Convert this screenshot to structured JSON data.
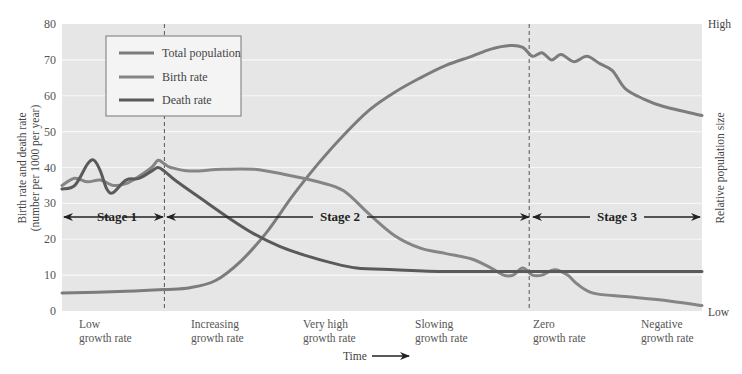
{
  "chart_data": {
    "type": "line",
    "title": "",
    "xlabel": "Time",
    "ylabel": "Birth rate and death rate",
    "ylabel_sub": "(number per 1000 per year)",
    "y2label": "Relative population size",
    "y2_ticks": {
      "high": "High",
      "low": "Low"
    },
    "ylim": [
      0,
      80
    ],
    "yticks": [
      0,
      10,
      20,
      30,
      40,
      50,
      60,
      70,
      80
    ],
    "grid": true,
    "legend_position": "upper-left",
    "x": [
      0,
      4,
      8,
      12,
      16,
      20,
      24,
      28,
      32,
      36,
      40,
      44,
      48,
      52,
      56,
      60,
      64,
      68,
      72,
      76,
      80,
      84,
      88,
      92,
      96,
      100
    ],
    "x_note": "x is relative time in percent of the horizontal axis (no numeric ticks shown)",
    "series": [
      {
        "name": "Total population",
        "color": "#7c7c7c",
        "axis": "right (relative, drawn on 0-80 scale)",
        "points": [
          [
            0,
            5
          ],
          [
            10,
            5.5
          ],
          [
            16,
            6
          ],
          [
            20,
            6.5
          ],
          [
            24,
            8.5
          ],
          [
            28,
            14
          ],
          [
            32,
            22
          ],
          [
            36,
            32
          ],
          [
            40,
            41
          ],
          [
            44,
            49
          ],
          [
            48,
            56
          ],
          [
            52,
            61
          ],
          [
            56,
            65
          ],
          [
            60,
            68.5
          ],
          [
            64,
            71
          ],
          [
            67,
            73
          ],
          [
            70,
            74
          ],
          [
            72,
            73.5
          ],
          [
            73.5,
            71
          ],
          [
            75,
            72
          ],
          [
            76.5,
            70
          ],
          [
            78,
            71.5
          ],
          [
            80,
            69.5
          ],
          [
            82,
            71
          ],
          [
            84,
            69
          ],
          [
            86,
            67
          ],
          [
            88,
            62
          ],
          [
            91,
            59
          ],
          [
            94,
            57
          ],
          [
            100,
            54.5
          ]
        ]
      },
      {
        "name": "Birth rate",
        "color": "#858585",
        "axis": "left",
        "points": [
          [
            0,
            35
          ],
          [
            2,
            37
          ],
          [
            4,
            36
          ],
          [
            6,
            36.5
          ],
          [
            8,
            35
          ],
          [
            10,
            35.5
          ],
          [
            12,
            37.5
          ],
          [
            14,
            40
          ],
          [
            15,
            42
          ],
          [
            16,
            41
          ],
          [
            17,
            40
          ],
          [
            20,
            39
          ],
          [
            25,
            39.5
          ],
          [
            30,
            39.5
          ],
          [
            35,
            38
          ],
          [
            40,
            36
          ],
          [
            44,
            33.5
          ],
          [
            48,
            27
          ],
          [
            52,
            21
          ],
          [
            56,
            17.5
          ],
          [
            60,
            16
          ],
          [
            64,
            14.5
          ],
          [
            67,
            12
          ],
          [
            69,
            10
          ],
          [
            70.5,
            10
          ],
          [
            72,
            12
          ],
          [
            73.5,
            10
          ],
          [
            75,
            10
          ],
          [
            77,
            11.5
          ],
          [
            79,
            10
          ],
          [
            80.5,
            7.5
          ],
          [
            83,
            5
          ],
          [
            88,
            4
          ],
          [
            94,
            3
          ],
          [
            100,
            1.5
          ]
        ]
      },
      {
        "name": "Death rate",
        "color": "#5a5a5a",
        "axis": "left",
        "points": [
          [
            0,
            34
          ],
          [
            2,
            35
          ],
          [
            4,
            41
          ],
          [
            5,
            42
          ],
          [
            6,
            39
          ],
          [
            7,
            34
          ],
          [
            8,
            33
          ],
          [
            10,
            36.5
          ],
          [
            12,
            37
          ],
          [
            14,
            39
          ],
          [
            15,
            40
          ],
          [
            16,
            39
          ],
          [
            18,
            36
          ],
          [
            22,
            31
          ],
          [
            26,
            26
          ],
          [
            30,
            21.5
          ],
          [
            34,
            18
          ],
          [
            38,
            15.5
          ],
          [
            42,
            13.5
          ],
          [
            46,
            12
          ],
          [
            52,
            11.5
          ],
          [
            60,
            11
          ],
          [
            70,
            11
          ],
          [
            80,
            11
          ],
          [
            90,
            11
          ],
          [
            100,
            11
          ]
        ]
      }
    ],
    "stage_boundaries_x": [
      16,
      73
    ],
    "stages": [
      {
        "label": "Stage 1",
        "from": 0,
        "to": 16
      },
      {
        "label": "Stage 2",
        "from": 16,
        "to": 73
      },
      {
        "label": "Stage 3",
        "from": 73,
        "to": 100
      }
    ],
    "annotations": [
      {
        "line1": "Low",
        "line2": "growth rate"
      },
      {
        "line1": "Increasing",
        "line2": "growth rate"
      },
      {
        "line1": "Very high",
        "line2": "growth rate"
      },
      {
        "line1": "Slowing",
        "line2": "growth rate"
      },
      {
        "line1": "Zero",
        "line2": "growth rate"
      },
      {
        "line1": "Negative",
        "line2": "growth rate"
      }
    ]
  },
  "legend": {
    "items": [
      {
        "label": "Total population",
        "color": "#7c7c7c"
      },
      {
        "label": "Birth rate",
        "color": "#858585"
      },
      {
        "label": "Death rate",
        "color": "#5a5a5a"
      }
    ]
  },
  "axes": {
    "ylabel": "Birth rate and death rate",
    "ylabel_sub": "(number per 1000 per year)",
    "y2label": "Relative population size",
    "high": "High",
    "low": "Low",
    "xlabel": "Time",
    "yticks": [
      "0",
      "10",
      "20",
      "30",
      "40",
      "50",
      "60",
      "70",
      "80"
    ]
  },
  "stages": {
    "s1": "Stage 1",
    "s2": "Stage 2",
    "s3": "Stage 3"
  },
  "phases": [
    {
      "line1": "Low",
      "line2": "growth rate"
    },
    {
      "line1": "Increasing",
      "line2": "growth rate"
    },
    {
      "line1": "Very high",
      "line2": "growth rate"
    },
    {
      "line1": "Slowing",
      "line2": "growth rate"
    },
    {
      "line1": "Zero",
      "line2": "growth rate"
    },
    {
      "line1": "Negative",
      "line2": "growth rate"
    }
  ],
  "colors": {
    "plot_bg": "#e6e6e6",
    "grid": "#f7f7f7",
    "population": "#7c7c7c",
    "birth": "#858585",
    "death": "#5a5a5a",
    "arrow": "#222222"
  }
}
